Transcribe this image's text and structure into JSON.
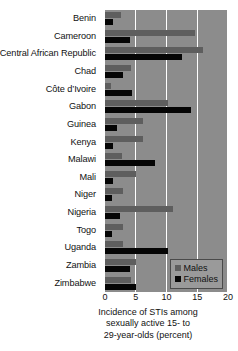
{
  "chart_data": {
    "type": "bar",
    "orientation": "horizontal",
    "title": "",
    "xlabel": "Incidence of STIs among sexually active 15- to 29-year-olds (percent)",
    "ylabel": "",
    "xlim": [
      0,
      20
    ],
    "xticks": [
      0,
      5,
      10,
      15,
      20
    ],
    "grid": true,
    "legend_position": "bottom-right",
    "categories": [
      "Benin",
      "Cameroon",
      "Central African Republic",
      "Chad",
      "Côte d’Ivoire",
      "Gabon",
      "Guinea",
      "Kenya",
      "Malawi",
      "Mali",
      "Niger",
      "Nigeria",
      "Togo",
      "Uganda",
      "Zambia",
      "Zimbabwe"
    ],
    "series": [
      {
        "name": "Males",
        "color": "#5e5e5e",
        "values": [
          2.6,
          14.7,
          16.0,
          4.2,
          1.0,
          10.2,
          6.1,
          6.1,
          2.7,
          5.0,
          3.0,
          11.0,
          3.0,
          3.0,
          5.0,
          4.3
        ]
      },
      {
        "name": "Females",
        "color": "#050505",
        "values": [
          1.3,
          4.0,
          12.6,
          2.9,
          4.4,
          14.0,
          2.0,
          1.3,
          8.2,
          1.3,
          1.2,
          2.5,
          1.2,
          10.2,
          4.0,
          5.0
        ]
      }
    ]
  },
  "axis": {
    "tick_labels": [
      "0",
      "5",
      "10",
      "15",
      "20"
    ],
    "title_lines": [
      "Incidence of STIs among",
      "sexually active 15- to",
      "29-year-olds (percent)"
    ]
  },
  "legend": {
    "items": [
      {
        "label": "Males",
        "color": "#5e5e5e"
      },
      {
        "label": "Females",
        "color": "#050505"
      }
    ]
  },
  "colors": {
    "plot_background": "#8c8c8c",
    "gridline": "#ffffff",
    "male_bar": "#5e5e5e",
    "female_bar": "#050505",
    "page_background": "#ffffff",
    "text": "#111111"
  }
}
